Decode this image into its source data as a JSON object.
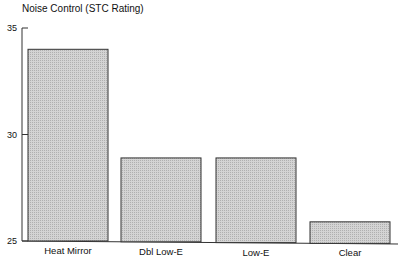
{
  "chart_data": {
    "type": "bar",
    "title": "Noise Control  (STC Rating)",
    "xlabel": "",
    "ylabel": "",
    "categories": [
      "Heat Mirror",
      "Dbl Low-E",
      "Low-E",
      "Clear"
    ],
    "values": [
      34,
      28.9,
      28.9,
      25.9
    ],
    "ylim": [
      25,
      35
    ],
    "yticks": [
      25,
      30,
      35
    ],
    "grid": false,
    "bar_color": "#c8c8c8",
    "edge_color": "#333333"
  }
}
